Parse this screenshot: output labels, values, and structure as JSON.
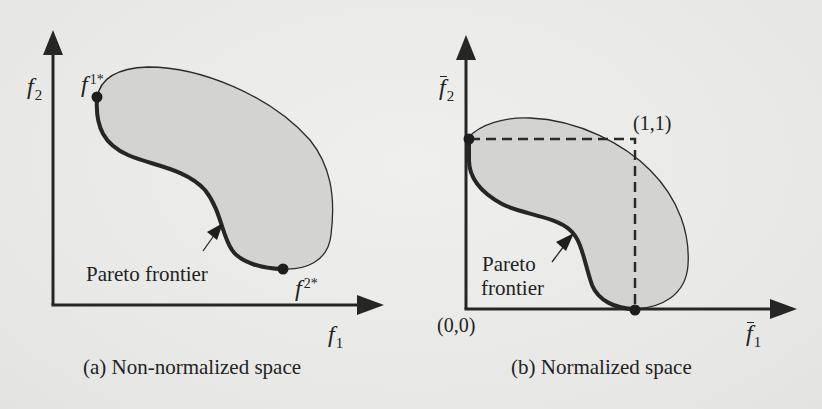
{
  "figure": {
    "background_color": "#ebebea",
    "region_fill_color": "#d2d2d1",
    "line_color": "#262626"
  },
  "panel_a": {
    "caption": "(a) Non-normalized space",
    "y_axis": {
      "symbol": "f",
      "subscript": "2"
    },
    "x_axis": {
      "symbol": "f",
      "subscript": "1"
    },
    "point_top": {
      "symbol": "f",
      "superscript": "1*"
    },
    "point_bottom": {
      "symbol": "f",
      "superscript": "2*"
    },
    "frontier_label": "Pareto frontier"
  },
  "panel_b": {
    "caption": "(b) Normalized space",
    "y_axis": {
      "symbol": "f",
      "subscript": "2",
      "overbar": true
    },
    "x_axis": {
      "symbol": "f",
      "subscript": "1",
      "overbar": true
    },
    "origin_label": "(0,0)",
    "corner_label": "(1,1)",
    "frontier_label_line1": "Pareto",
    "frontier_label_line2": "frontier"
  }
}
